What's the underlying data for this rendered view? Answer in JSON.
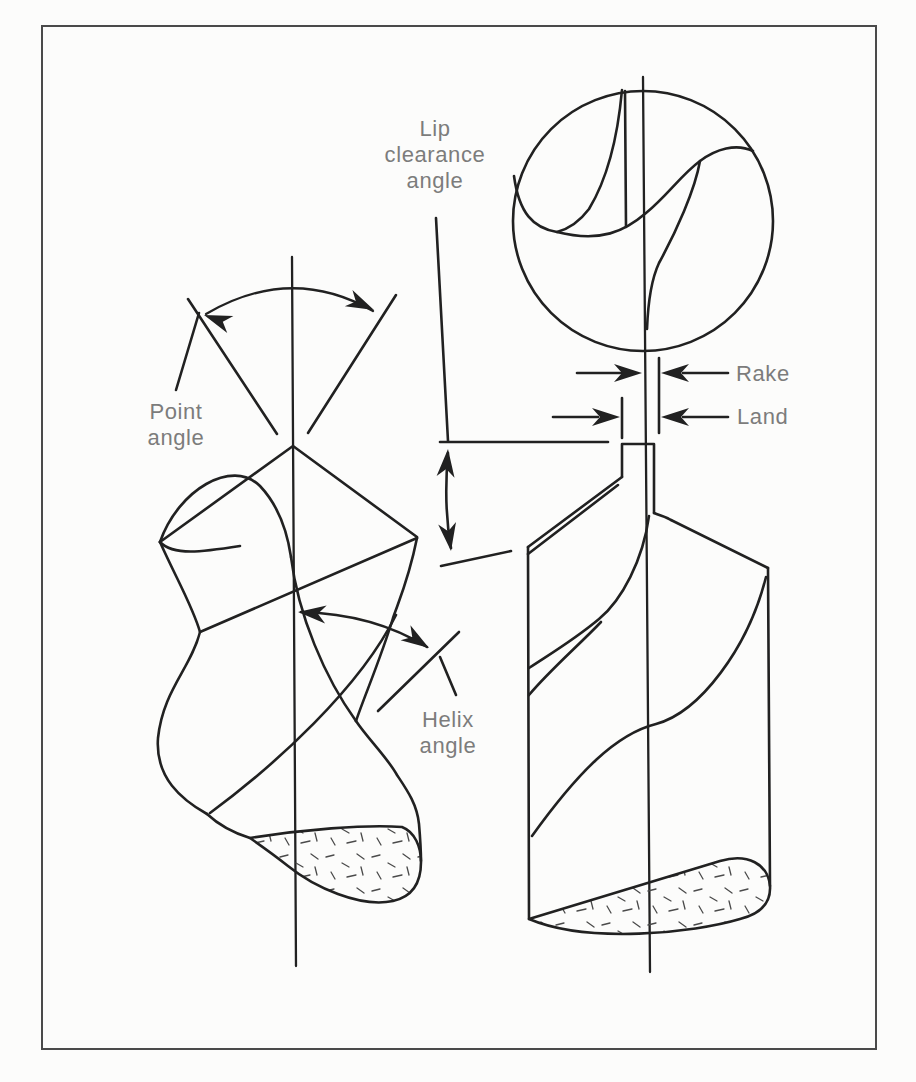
{
  "labels": {
    "lip_clearance_angle": "Lip\nclearance\nangle",
    "point_angle": "Point\nangle",
    "helix_angle": "Helix\nangle",
    "rake": "Rake",
    "land": "Land"
  },
  "colors": {
    "background": "#fcfcfb",
    "ink": "#212121",
    "label_text": "#7c7c7c",
    "border": "#4a4a4a"
  }
}
